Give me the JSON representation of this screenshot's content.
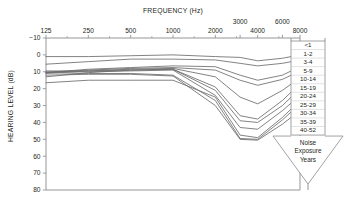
{
  "chart_data": {
    "type": "line",
    "title": "",
    "xlabel": "FREQUENCY (Hz)",
    "ylabel": "HEARING LEVEL (dB)",
    "x_scale": "log-octave",
    "x_ticks": [
      "125",
      "250",
      "500",
      "1000",
      "2000",
      "3000",
      "4000",
      "6000",
      "8000"
    ],
    "x_ticks_lower_row": [
      "125",
      "250",
      "500",
      "1000",
      "2000",
      "4000",
      "8000"
    ],
    "x_ticks_upper_row": [
      "3000",
      "6000"
    ],
    "x": [
      125,
      250,
      500,
      1000,
      2000,
      3000,
      4000,
      6000,
      8000
    ],
    "y_ticks": [
      "-10",
      "0",
      "10",
      "20",
      "30",
      "40",
      "50",
      "60",
      "70",
      "80"
    ],
    "ylim": [
      -10,
      80
    ],
    "y_inverted": true,
    "grid": false,
    "legend_position": "right",
    "legend_title": "Noise Exposure Years",
    "line_color": "#6d6d6d",
    "axis_color": "#8a8a8a",
    "series": [
      {
        "name": "<1",
        "values": [
          1.0,
          1.0,
          0.5,
          0.0,
          1.0,
          1.5,
          3.5,
          2.0,
          0.0
        ]
      },
      {
        "name": "1-2",
        "values": [
          5.5,
          4.0,
          2.5,
          2.5,
          3.0,
          5.0,
          6.5,
          5.0,
          3.0
        ]
      },
      {
        "name": "3-4",
        "values": [
          10.5,
          8.5,
          7.5,
          6.5,
          7.0,
          12.0,
          15.0,
          12.0,
          7.0
        ]
      },
      {
        "name": "5-9",
        "values": [
          10.5,
          9.0,
          8.0,
          7.5,
          9.0,
          15.0,
          18.0,
          14.5,
          9.5
        ]
      },
      {
        "name": "10-14",
        "values": [
          11.0,
          9.5,
          8.5,
          8.0,
          13.0,
          25.0,
          29.0,
          21.0,
          13.5
        ]
      },
      {
        "name": "15-19",
        "values": [
          13.0,
          10.5,
          9.0,
          8.5,
          19.0,
          36.0,
          38.0,
          27.0,
          17.0
        ]
      },
      {
        "name": "20-24",
        "values": [
          9.5,
          9.5,
          9.0,
          8.5,
          21.0,
          39.0,
          40.0,
          30.0,
          20.0
        ]
      },
      {
        "name": "25-29",
        "values": [
          10.0,
          10.0,
          9.5,
          9.0,
          24.0,
          43.0,
          44.0,
          33.0,
          24.0
        ]
      },
      {
        "name": "30-34",
        "values": [
          16.5,
          15.0,
          15.0,
          15.0,
          25.0,
          47.5,
          49.0,
          37.0,
          27.0
        ]
      },
      {
        "name": "35-39",
        "values": [
          10.5,
          11.0,
          11.0,
          12.0,
          27.0,
          49.5,
          50.0,
          38.5,
          29.0
        ]
      },
      {
        "name": "40-52",
        "values": [
          12.0,
          11.5,
          11.5,
          12.5,
          30.0,
          50.0,
          50.5,
          41.0,
          33.0
        ]
      }
    ]
  },
  "axes": {
    "x_title": "FREQUENCY (Hz)",
    "y_title": "HEARING LEVEL (dB)"
  },
  "legend": {
    "items": [
      {
        "label": "<1"
      },
      {
        "label": "1-2"
      },
      {
        "label": "3-4"
      },
      {
        "label": "5-9"
      },
      {
        "label": "10-14"
      },
      {
        "label": "15-19"
      },
      {
        "label": "20-24"
      },
      {
        "label": "25-29"
      },
      {
        "label": "30-34"
      },
      {
        "label": "35-39"
      },
      {
        "label": "40-52"
      }
    ],
    "arrow_lines": [
      "Noise",
      "Exposure",
      "Years"
    ]
  }
}
